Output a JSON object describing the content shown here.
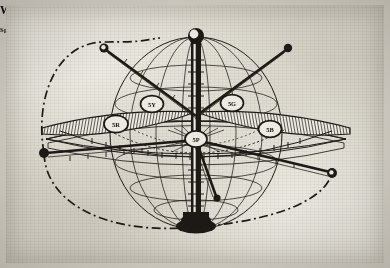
{
  "figure": {
    "fig_number": "Fig. 2.",
    "cross_reference": "(See Fig. 20)",
    "title": "The Color Tree",
    "signature": "M·M",
    "medium": "engraving",
    "paper_color": "#eceae2",
    "ink_color": "#1d1a16"
  },
  "poles": {
    "top": "White",
    "bottom": "Black"
  },
  "hues": [
    {
      "name": "Yellow",
      "notation": "5Y",
      "position": "upper-left"
    },
    {
      "name": "Red",
      "notation": "5R",
      "position": "left"
    },
    {
      "name": "Green",
      "notation": "5G",
      "position": "upper-right"
    },
    {
      "name": "Blue",
      "notation": "5B",
      "position": "right"
    },
    {
      "name": "Purple",
      "notation": "5P",
      "position": "front-center"
    }
  ],
  "axis_labels": {
    "value": "Scale of VALUE",
    "chroma": "Scale of CHROMA",
    "hue": "Scale of HUE",
    "spectrum": "Spectrum"
  },
  "chroma_ticks": [
    "2",
    "4",
    "6",
    "8",
    "10"
  ],
  "value_ticks": [
    "1",
    "2",
    "3",
    "4",
    "5",
    "6",
    "7",
    "8",
    "9"
  ]
}
